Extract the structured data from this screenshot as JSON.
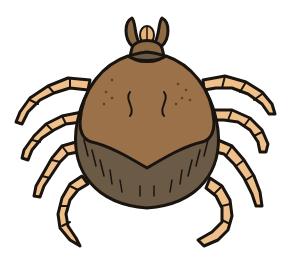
{
  "illustration": {
    "subject": "tick",
    "alt": "Cartoon illustration of a brown tick with eight segmented legs",
    "colors": {
      "background": "#ffffff",
      "outline": "#1a1410",
      "scutum": "#9a7149",
      "abdomen": "#6b5a45",
      "legs": "#f0c08a",
      "mouthparts": "#8c6a44",
      "hypostome": "#e8b47a",
      "spots": "#6a3e24"
    }
  }
}
